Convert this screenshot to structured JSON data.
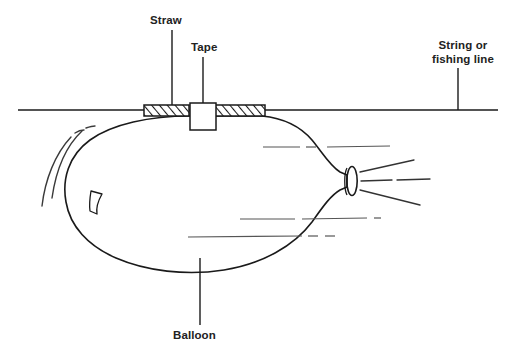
{
  "figure": {
    "background_color": "#ffffff",
    "line_color": "#1a1a1a",
    "text_color": "#222222",
    "detail_line_color": "#555555",
    "width": 516,
    "height": 359
  },
  "labels": {
    "straw": "Straw",
    "tape": "Tape",
    "string_line1": "String or",
    "string_line2": "fishing line",
    "balloon": "Balloon"
  },
  "parts": {
    "string": {
      "name": "String or fishing line",
      "orientation": "horizontal",
      "y": 110,
      "x_start": 18,
      "x_end": 498
    },
    "straw": {
      "name": "Straw",
      "style": "hatched",
      "segments": [
        {
          "x": 144,
          "y": 105,
          "width": 45,
          "height": 11
        },
        {
          "x": 215,
          "y": 105,
          "width": 50,
          "height": 11
        }
      ]
    },
    "tape": {
      "name": "Tape",
      "style": "outline",
      "x": 190,
      "y": 103,
      "width": 26,
      "height": 27
    },
    "balloon": {
      "name": "Balloon",
      "style": "outline",
      "nozzle": {
        "cx": 352,
        "cy": 181,
        "rx": 5,
        "ry": 14
      }
    },
    "air_jet": {
      "name": "escaping air",
      "line_count": 4
    },
    "motion_arcs": {
      "name": "motion arcs",
      "count": 2,
      "side": "left"
    }
  },
  "leaders": [
    {
      "name": "straw-leader",
      "x": 172,
      "y_top": 30,
      "y_bottom": 105
    },
    {
      "name": "tape-leader",
      "x": 203,
      "y_top": 57,
      "y_bottom": 103
    },
    {
      "name": "string-leader",
      "x": 458,
      "y_top": 68,
      "y_bottom": 110
    },
    {
      "name": "balloon-leader",
      "x": 200,
      "y_top": 258,
      "y_bottom": 325
    }
  ]
}
